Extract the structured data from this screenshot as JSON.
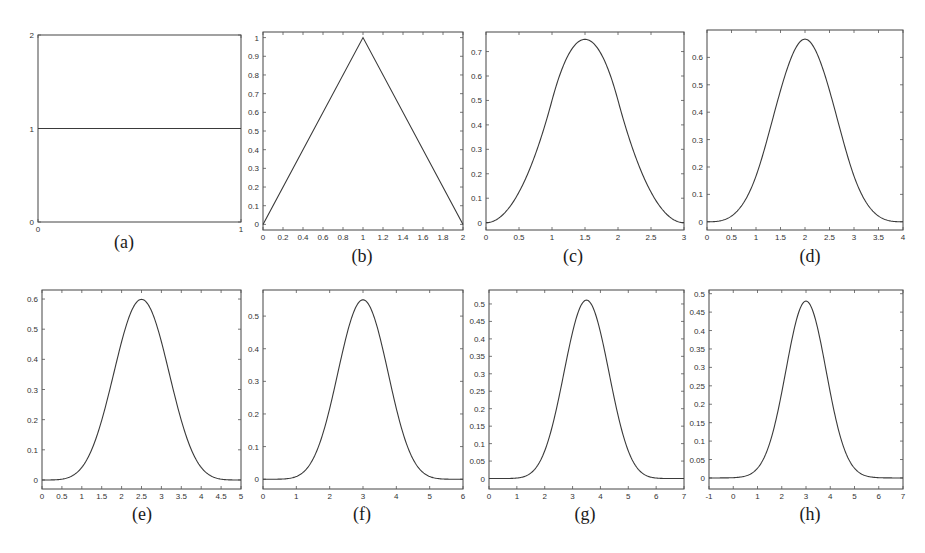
{
  "figure": {
    "panel_count": 8,
    "line_color": "#3a3a3a",
    "frame_color": "#444444"
  },
  "chart_data": [
    {
      "id": "a",
      "caption": "(a)",
      "type": "line",
      "title": "",
      "xlabel": "",
      "ylabel": "",
      "xlim": [
        0,
        1
      ],
      "ylim": [
        0,
        2
      ],
      "grid": false,
      "xticks": [
        0,
        1
      ],
      "xtick_labels": [
        "0",
        "1"
      ],
      "yticks": [
        0,
        1,
        2
      ],
      "ytick_labels": [
        "0",
        "1",
        "2"
      ],
      "function": "box (B-spline order 1)",
      "x": [
        0,
        1
      ],
      "y": [
        1,
        1
      ],
      "box": [
        38,
        35,
        241,
        222
      ],
      "caption_pos": [
        124,
        248
      ]
    },
    {
      "id": "b",
      "caption": "(b)",
      "type": "line",
      "title": "",
      "xlabel": "",
      "ylabel": "",
      "xlim": [
        0,
        2
      ],
      "ylim": [
        -0.03,
        1.03
      ],
      "grid": false,
      "xticks": [
        0,
        0.2,
        0.4,
        0.6,
        0.8,
        1,
        1.2,
        1.4,
        1.6,
        1.8,
        2
      ],
      "xtick_labels": [
        "0",
        "0.2",
        "0.4",
        "0.6",
        "0.8",
        "1",
        "1.2",
        "1.4",
        "1.6",
        "1.8",
        "2"
      ],
      "yticks": [
        0,
        0.1,
        0.2,
        0.3,
        0.4,
        0.5,
        0.6,
        0.7,
        0.8,
        0.9,
        1
      ],
      "ytick_labels": [
        "0",
        "0.1",
        "0.2",
        "0.3",
        "0.4",
        "0.5",
        "0.6",
        "0.7",
        "0.8",
        "0.9",
        "1"
      ],
      "function": "hat (B-spline order 2)",
      "x": [
        0,
        1,
        2
      ],
      "y": [
        0,
        1,
        0
      ],
      "box": [
        263,
        32,
        463,
        230
      ],
      "caption_pos": [
        362,
        262
      ]
    },
    {
      "id": "c",
      "caption": "(c)",
      "type": "line",
      "title": "",
      "xlabel": "",
      "ylabel": "",
      "xlim": [
        0,
        3
      ],
      "ylim": [
        -0.03,
        0.78
      ],
      "grid": false,
      "xticks": [
        0,
        0.5,
        1,
        1.5,
        2,
        2.5,
        3
      ],
      "xtick_labels": [
        "0",
        "0.5",
        "1",
        "1.5",
        "2",
        "2.5",
        "3"
      ],
      "yticks": [
        0,
        0.1,
        0.2,
        0.3,
        0.4,
        0.5,
        0.6,
        0.7
      ],
      "ytick_labels": [
        "0",
        "0.1",
        "0.2",
        "0.3",
        "0.4",
        "0.5",
        "0.6",
        "0.7"
      ],
      "function": "quadratic B-spline (order 3)",
      "peak": {
        "x": 1.5,
        "y": 0.75
      },
      "box": [
        486,
        32,
        684,
        230
      ],
      "caption_pos": [
        573,
        262
      ]
    },
    {
      "id": "d",
      "caption": "(d)",
      "type": "line",
      "title": "",
      "xlabel": "",
      "ylabel": "",
      "xlim": [
        0,
        4
      ],
      "ylim": [
        -0.03,
        0.7
      ],
      "grid": false,
      "xticks": [
        0,
        0.5,
        1,
        1.5,
        2,
        2.5,
        3,
        3.5,
        4
      ],
      "xtick_labels": [
        "0",
        "0.5",
        "1",
        "1.5",
        "2",
        "2.5",
        "3",
        "3.5",
        "4"
      ],
      "yticks": [
        0,
        0.1,
        0.2,
        0.3,
        0.4,
        0.5,
        0.6
      ],
      "ytick_labels": [
        "0",
        "0.1",
        "0.2",
        "0.3",
        "0.4",
        "0.5",
        "0.6"
      ],
      "function": "cubic B-spline (order 4)",
      "peak": {
        "x": 2,
        "y": 0.667
      },
      "box": [
        707,
        30,
        903,
        230
      ],
      "caption_pos": [
        810,
        262
      ]
    },
    {
      "id": "e",
      "caption": "(e)",
      "type": "line",
      "title": "",
      "xlabel": "",
      "ylabel": "",
      "xlim": [
        0,
        5
      ],
      "ylim": [
        -0.03,
        0.63
      ],
      "grid": false,
      "xticks": [
        0,
        0.5,
        1,
        1.5,
        2,
        2.5,
        3,
        3.5,
        4,
        4.5,
        5
      ],
      "xtick_labels": [
        "0",
        "0.5",
        "1",
        "1.5",
        "2",
        "2.5",
        "3",
        "3.5",
        "4",
        "4.5",
        "5"
      ],
      "yticks": [
        0,
        0.1,
        0.2,
        0.3,
        0.4,
        0.5,
        0.6
      ],
      "ytick_labels": [
        "0",
        "0.1",
        "0.2",
        "0.3",
        "0.4",
        "0.5",
        "0.6"
      ],
      "function": "quartic B-spline (order 5)",
      "peak": {
        "x": 2.5,
        "y": 0.599
      },
      "box": [
        42,
        290,
        241,
        489
      ],
      "caption_pos": [
        142,
        520
      ]
    },
    {
      "id": "f",
      "caption": "(f)",
      "type": "line",
      "title": "",
      "xlabel": "",
      "ylabel": "",
      "xlim": [
        0,
        6
      ],
      "ylim": [
        -0.03,
        0.58
      ],
      "grid": false,
      "xticks": [
        0,
        1,
        2,
        3,
        4,
        5,
        6
      ],
      "xtick_labels": [
        "0",
        "1",
        "2",
        "3",
        "4",
        "5",
        "6"
      ],
      "yticks": [
        0,
        0.1,
        0.2,
        0.3,
        0.4,
        0.5
      ],
      "ytick_labels": [
        "0",
        "0.1",
        "0.2",
        "0.3",
        "0.4",
        "0.5"
      ],
      "function": "quintic B-spline (order 6)",
      "peak": {
        "x": 3,
        "y": 0.55
      },
      "box": [
        263,
        290,
        463,
        489
      ],
      "caption_pos": [
        362,
        520
      ]
    },
    {
      "id": "g",
      "caption": "(g)",
      "type": "line",
      "title": "",
      "xlabel": "",
      "ylabel": "",
      "xlim": [
        0,
        7
      ],
      "ylim": [
        -0.03,
        0.54
      ],
      "grid": false,
      "xticks": [
        0,
        1,
        2,
        3,
        4,
        5,
        6,
        7
      ],
      "xtick_labels": [
        "0",
        "1",
        "2",
        "3",
        "4",
        "5",
        "6",
        "7"
      ],
      "yticks": [
        0,
        0.05,
        0.1,
        0.15,
        0.2,
        0.25,
        0.3,
        0.35,
        0.4,
        0.45,
        0.5
      ],
      "ytick_labels": [
        "0",
        "0.05",
        "0.1",
        "0.15",
        "0.2",
        "0.25",
        "0.3",
        "0.35",
        "0.4",
        "0.45",
        "0.5"
      ],
      "function": "B-spline order 7",
      "peak": {
        "x": 3.5,
        "y": 0.511
      },
      "box": [
        489,
        290,
        684,
        489
      ],
      "caption_pos": [
        585,
        520
      ]
    },
    {
      "id": "h",
      "caption": "(h)",
      "type": "line",
      "title": "",
      "xlabel": "",
      "ylabel": "",
      "xlim": [
        -1,
        7
      ],
      "ylim": [
        -0.03,
        0.51
      ],
      "grid": false,
      "xticks": [
        -1,
        0,
        1,
        2,
        3,
        4,
        5,
        6,
        7
      ],
      "xtick_labels": [
        "-1",
        "0",
        "1",
        "2",
        "3",
        "4",
        "5",
        "6",
        "7"
      ],
      "yticks": [
        0,
        0.05,
        0.1,
        0.15,
        0.2,
        0.25,
        0.3,
        0.35,
        0.4,
        0.45,
        0.5
      ],
      "ytick_labels": [
        "0",
        "0.05",
        "0.1",
        "0.15",
        "0.2",
        "0.25",
        "0.3",
        "0.35",
        "0.4",
        "0.45",
        "0.5"
      ],
      "function": "bell curve",
      "peak": {
        "x": 3,
        "y": 0.48
      },
      "box": [
        709,
        290,
        903,
        489
      ],
      "caption_pos": [
        810,
        520
      ]
    }
  ]
}
